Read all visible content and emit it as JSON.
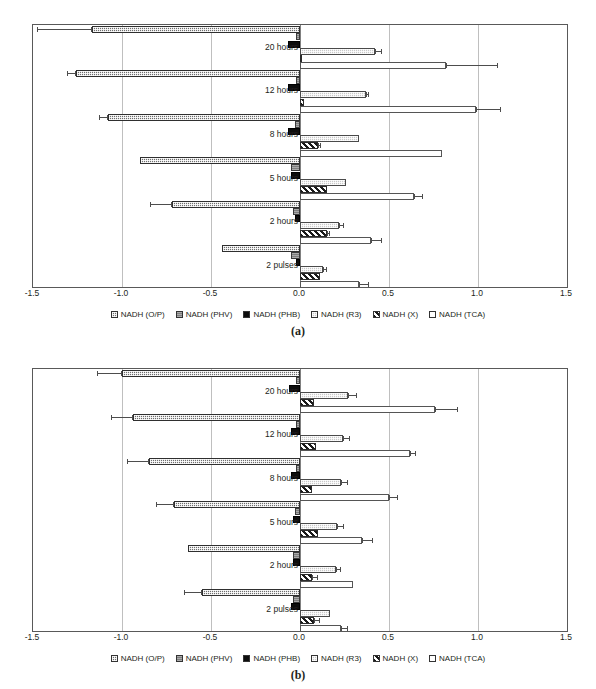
{
  "chart_data": [
    {
      "type": "bar",
      "orientation": "horizontal",
      "panel": "a",
      "caption": "(a)",
      "title": "",
      "xlabel": "",
      "ylabel": "",
      "xlim": [
        -1.5,
        1.5
      ],
      "xticks": [
        "-1.5",
        "-1.0",
        "-0.5",
        "0.0",
        "0.5",
        "1.0",
        "1.5"
      ],
      "xtick_values": [
        -1.5,
        -1.0,
        -0.5,
        0.0,
        0.5,
        1.0,
        1.5
      ],
      "grid": true,
      "legend_position": "bottom",
      "categories": [
        "20 hours",
        "12 hours",
        "8 hours",
        "5 hours",
        "2 hours",
        "2 pulses"
      ],
      "series": [
        {
          "name": "NADH (O/P)",
          "key": "op",
          "values": [
            -1.17,
            -1.26,
            -1.08,
            -0.9,
            -0.72,
            -0.44
          ],
          "errors": [
            0.31,
            0.05,
            0.05,
            0.0,
            0.12,
            0.0
          ]
        },
        {
          "name": "NADH (PHV)",
          "key": "phv",
          "values": [
            -0.02,
            -0.02,
            -0.03,
            -0.05,
            -0.04,
            -0.05
          ],
          "errors": [
            0.0,
            0.0,
            0.0,
            0.0,
            0.0,
            0.0
          ]
        },
        {
          "name": "NADH (PHB)",
          "key": "phb",
          "values": [
            -0.07,
            -0.07,
            -0.07,
            -0.05,
            -0.03,
            -0.02
          ],
          "errors": [
            0.0,
            0.0,
            0.0,
            0.0,
            0.0,
            0.0
          ]
        },
        {
          "name": "NADH (R3)",
          "key": "r3",
          "values": [
            0.42,
            0.37,
            0.33,
            0.26,
            0.22,
            0.13
          ],
          "errors": [
            0.04,
            0.02,
            0.0,
            0.0,
            0.03,
            0.02
          ]
        },
        {
          "name": "NADH (X)",
          "key": "x",
          "values": [
            0.0,
            0.02,
            0.1,
            0.15,
            0.15,
            0.11
          ],
          "errors": [
            0.0,
            0.0,
            0.02,
            0.0,
            0.02,
            0.0
          ]
        },
        {
          "name": "NADH (TCA)",
          "key": "tca",
          "values": [
            0.82,
            0.99,
            0.8,
            0.64,
            0.4,
            0.33
          ],
          "errors": [
            0.29,
            0.14,
            0.0,
            0.05,
            0.06,
            0.06
          ]
        }
      ]
    },
    {
      "type": "bar",
      "orientation": "horizontal",
      "panel": "b",
      "caption": "(b)",
      "title": "",
      "xlabel": "",
      "ylabel": "",
      "xlim": [
        -1.5,
        1.5
      ],
      "xticks": [
        "-1.5",
        "-1.0",
        "-0.5",
        "0.0",
        "0.5",
        "1.0",
        "1.5"
      ],
      "xtick_values": [
        -1.5,
        -1.0,
        -0.5,
        0.0,
        0.5,
        1.0,
        1.5
      ],
      "grid": true,
      "legend_position": "bottom",
      "categories": [
        "20 hours",
        "12 hours",
        "8 hours",
        "5 hours",
        "2 hours",
        "2 pulses"
      ],
      "series": [
        {
          "name": "NADH (O/P)",
          "key": "op",
          "values": [
            -1.0,
            -0.94,
            -0.85,
            -0.71,
            -0.63,
            -0.55
          ],
          "errors": [
            0.14,
            0.12,
            0.12,
            0.1,
            0.0,
            0.1
          ]
        },
        {
          "name": "NADH (PHV)",
          "key": "phv",
          "values": [
            -0.02,
            -0.02,
            -0.02,
            -0.03,
            -0.04,
            -0.04
          ],
          "errors": [
            0.0,
            0.0,
            0.0,
            0.0,
            0.0,
            0.0
          ]
        },
        {
          "name": "NADH (PHB)",
          "key": "phb",
          "values": [
            -0.06,
            -0.05,
            -0.05,
            -0.04,
            -0.04,
            -0.05
          ],
          "errors": [
            0.0,
            0.0,
            0.0,
            0.0,
            0.0,
            0.0
          ]
        },
        {
          "name": "NADH (R3)",
          "key": "r3",
          "values": [
            0.27,
            0.24,
            0.23,
            0.21,
            0.2,
            0.17
          ],
          "errors": [
            0.05,
            0.04,
            0.04,
            0.04,
            0.03,
            0.0
          ]
        },
        {
          "name": "NADH (X)",
          "key": "x",
          "values": [
            0.08,
            0.09,
            0.07,
            0.1,
            0.07,
            0.08
          ],
          "errors": [
            0.0,
            0.0,
            0.0,
            0.0,
            0.03,
            0.03
          ]
        },
        {
          "name": "NADH (TCA)",
          "key": "tca",
          "values": [
            0.76,
            0.62,
            0.5,
            0.35,
            0.3,
            0.23
          ],
          "errors": [
            0.13,
            0.03,
            0.05,
            0.06,
            0.0,
            0.04
          ]
        }
      ]
    }
  ],
  "legend": {
    "items": [
      {
        "label": "NADH (O/P)",
        "key": "op"
      },
      {
        "label": "NADH (PHV)",
        "key": "phv"
      },
      {
        "label": "NADH (PHB)",
        "key": "phb"
      },
      {
        "label": "NADH (R3)",
        "key": "r3"
      },
      {
        "label": "NADH (X)",
        "key": "x"
      },
      {
        "label": "NADH (TCA)",
        "key": "tca"
      }
    ]
  },
  "captions": {
    "a": "(a)",
    "b": "(b)"
  }
}
